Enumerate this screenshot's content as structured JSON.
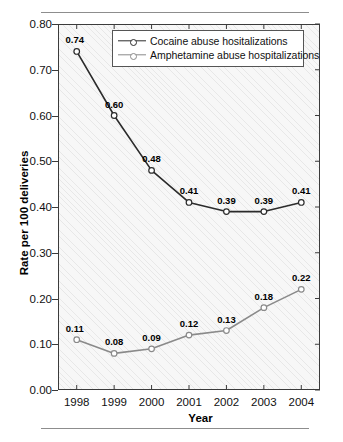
{
  "chart_data": {
    "type": "line",
    "title": "",
    "xlabel": "Year",
    "ylabel": "Rate per 100 deliveries",
    "categories": [
      "1998",
      "1999",
      "2000",
      "2001",
      "2002",
      "2003",
      "2004"
    ],
    "x": [
      1998,
      1999,
      2000,
      2001,
      2002,
      2003,
      2004
    ],
    "xlim": [
      1997.5,
      2004.5
    ],
    "ylim": [
      0.0,
      0.8
    ],
    "yticks": [
      "0.00",
      "0.10",
      "0.20",
      "0.30",
      "0.40",
      "0.50",
      "0.60",
      "0.70",
      "0.80"
    ],
    "ytick_values": [
      0.0,
      0.1,
      0.2,
      0.3,
      0.4,
      0.5,
      0.6,
      0.7,
      0.8
    ],
    "grid": false,
    "legend_position": "top-center-inside",
    "show_point_labels": true,
    "series": [
      {
        "name": "Cocaine abuse hositalizations",
        "color": "#2b2b2b",
        "marker": "open-circle",
        "values": [
          0.74,
          0.6,
          0.48,
          0.41,
          0.39,
          0.39,
          0.41
        ],
        "labels": [
          "0.74",
          "0.60",
          "0.48",
          "0.41",
          "0.39",
          "0.39",
          "0.41"
        ]
      },
      {
        "name": "Amphetamine abuse hospitalizations",
        "color": "#8a8a8a",
        "marker": "open-circle",
        "values": [
          0.11,
          0.08,
          0.09,
          0.12,
          0.13,
          0.18,
          0.22
        ],
        "labels": [
          "0.11",
          "0.08",
          "0.09",
          "0.12",
          "0.13",
          "0.18",
          "0.22"
        ]
      }
    ]
  },
  "legend": {
    "entries": [
      {
        "label": "Cocaine abuse hositalizations"
      },
      {
        "label": "Amphetamine abuse hospitalizations"
      }
    ]
  },
  "colors": {
    "series_cocaine": "#2b2b2b",
    "series_amphetamine": "#8a8a8a",
    "frame": "#3b3b3b",
    "plot_background": "#f7f7f7",
    "rule": "#8d8d8d"
  }
}
